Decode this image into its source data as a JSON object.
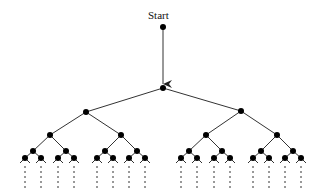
{
  "diagram": {
    "start_label": "Start",
    "colors": {
      "edge": "#333333",
      "node": "#000000",
      "background": "#ffffff"
    },
    "start_node": {
      "x": 163,
      "y": 27
    },
    "root": {
      "x": 163,
      "y": 88
    },
    "levels": [
      [
        {
          "x": 86,
          "y": 112
        },
        {
          "x": 241,
          "y": 111
        }
      ],
      [
        {
          "x": 50,
          "y": 135
        },
        {
          "x": 121,
          "y": 135
        },
        {
          "x": 206,
          "y": 135
        },
        {
          "x": 277,
          "y": 135
        }
      ],
      [
        {
          "x": 33,
          "y": 151
        },
        {
          "x": 66,
          "y": 151
        },
        {
          "x": 105,
          "y": 151
        },
        {
          "x": 137,
          "y": 151
        },
        {
          "x": 189,
          "y": 151
        },
        {
          "x": 222,
          "y": 151
        },
        {
          "x": 261,
          "y": 151
        },
        {
          "x": 293,
          "y": 151
        }
      ],
      [
        {
          "x": 25,
          "y": 158
        },
        {
          "x": 41,
          "y": 158
        },
        {
          "x": 58,
          "y": 158
        },
        {
          "x": 74,
          "y": 158
        },
        {
          "x": 97,
          "y": 158
        },
        {
          "x": 113,
          "y": 158
        },
        {
          "x": 129,
          "y": 158
        },
        {
          "x": 145,
          "y": 158
        },
        {
          "x": 181,
          "y": 158
        },
        {
          "x": 197,
          "y": 158
        },
        {
          "x": 214,
          "y": 158
        },
        {
          "x": 230,
          "y": 158
        },
        {
          "x": 253,
          "y": 158
        },
        {
          "x": 269,
          "y": 158
        },
        {
          "x": 285,
          "y": 158
        },
        {
          "x": 301,
          "y": 158
        }
      ]
    ],
    "leaf_stub": {
      "dx": 5,
      "dy": 5
    },
    "continuation": {
      "y1": 166,
      "y2": 188,
      "style": "dashed"
    }
  }
}
